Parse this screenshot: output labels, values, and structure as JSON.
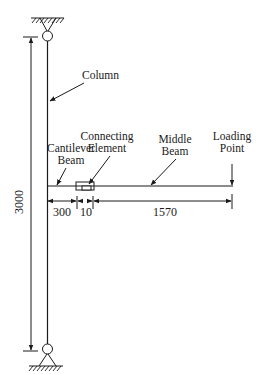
{
  "diagram": {
    "type": "structural-schematic",
    "labels": {
      "column": "Column",
      "cantilever_line1": "Cantilever",
      "cantilever_line2": "Beam",
      "connecting_line1": "Connecting",
      "connecting_line2": "Element",
      "middle_line1": "Middle",
      "middle_line2": "Beam",
      "loading_line1": "Loading",
      "loading_line2": "Point"
    },
    "dimensions": {
      "column_height": "3000",
      "cantilever_length": "300",
      "connector_length": "10",
      "middle_beam_length": "1570"
    },
    "colors": {
      "line": "#1a1a1a",
      "background": "#ffffff"
    }
  }
}
